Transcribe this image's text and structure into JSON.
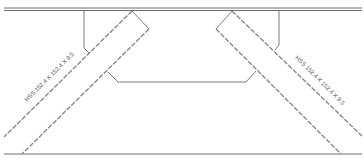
{
  "drawing": {
    "type": "structural brace connection detail",
    "colors": {
      "line": "#6e6e6e",
      "dash": "#9a9a9a",
      "background": "#ffffff"
    }
  },
  "labels": {
    "left_brace": "HSS 152.4 X 152.4 X 9.5",
    "right_brace": "HSS 152.4 X 152.4 X 9.5"
  }
}
